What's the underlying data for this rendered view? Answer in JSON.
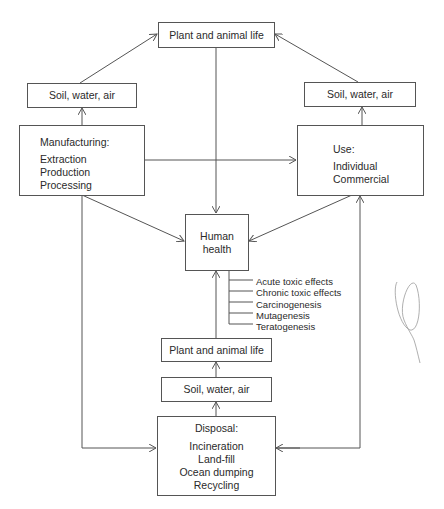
{
  "diagram": {
    "nodes": {
      "top_plant": {
        "label": "Plant and animal life"
      },
      "left_soil": {
        "label": "Soil, water, air"
      },
      "right_soil": {
        "label": "Soil, water, air"
      },
      "manufacturing": {
        "title": "Manufacturing:",
        "items": [
          "Extraction",
          "Production",
          "Processing"
        ]
      },
      "use": {
        "title": "Use:",
        "items": [
          "Individual",
          "Commercial"
        ]
      },
      "human_health": {
        "label_lines": [
          "Human",
          "health"
        ]
      },
      "bottom_plant": {
        "label": "Plant and animal life"
      },
      "bottom_soil": {
        "label": "Soil, water, air"
      },
      "disposal": {
        "title": "Disposal:",
        "items": [
          "Incineration",
          "Land-fill",
          "Ocean dumping",
          "Recycling"
        ]
      }
    },
    "effects": [
      "Acute toxic effects",
      "Chronic toxic effects",
      "Carcinogenesis",
      "Mutagenesis",
      "Teratogenesis"
    ],
    "edges": [
      {
        "from": "manufacturing",
        "to": "left_soil"
      },
      {
        "from": "left_soil",
        "to": "top_plant"
      },
      {
        "from": "use",
        "to": "right_soil"
      },
      {
        "from": "right_soil",
        "to": "top_plant"
      },
      {
        "from": "manufacturing",
        "to": "use"
      },
      {
        "from": "top_plant",
        "to": "human_health"
      },
      {
        "from": "manufacturing",
        "to": "human_health"
      },
      {
        "from": "use",
        "to": "human_health"
      },
      {
        "from": "manufacturing",
        "to": "disposal"
      },
      {
        "from": "disposal",
        "to": "use"
      },
      {
        "from": "use",
        "to": "disposal"
      },
      {
        "from": "disposal",
        "to": "bottom_soil"
      },
      {
        "from": "bottom_soil",
        "to": "bottom_plant"
      },
      {
        "from": "bottom_plant",
        "to": "human_health"
      }
    ],
    "colors": {
      "line": "#555555",
      "text": "#2a2a2a",
      "background": "#ffffff"
    }
  }
}
